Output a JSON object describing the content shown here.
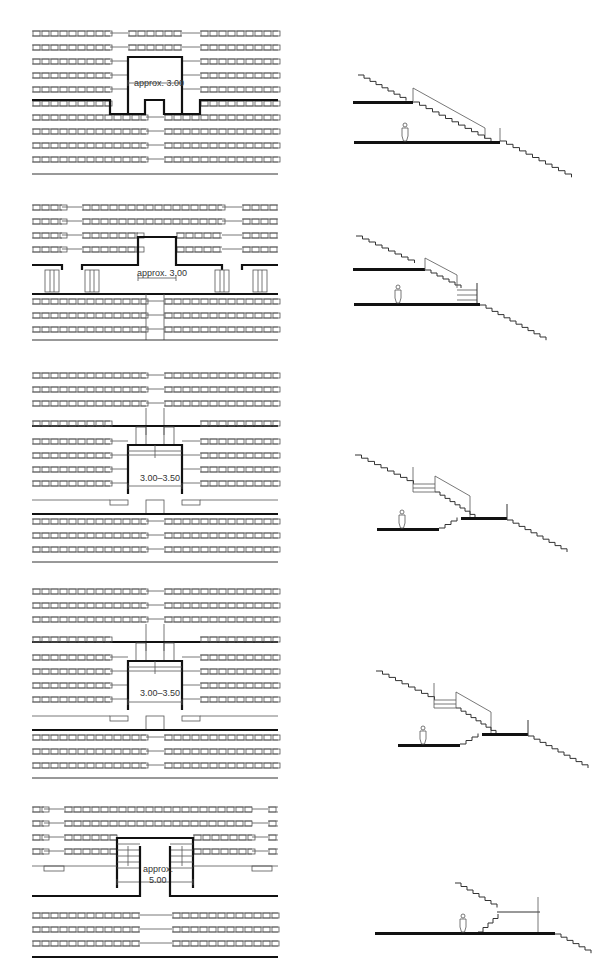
{
  "figure": {
    "type": "architectural stair/seating arrangement comparison",
    "layout": "five rows, each with plan view (left) and section view (right)"
  },
  "rows": [
    {
      "id": 1,
      "plan_label": "approx. 3.00",
      "section": "vomitory entering mid-level walkway, tiers continue above and below"
    },
    {
      "id": 2,
      "plan_label": "approx. 3.00",
      "section": "walkway with short stair down to lower level"
    },
    {
      "id": 3,
      "plan_label": "3.00–3.50",
      "section": "split-level with steps up to raised platform"
    },
    {
      "id": 4,
      "plan_label": "3.00–3.50",
      "section": "split-level with steps up to raised platform"
    },
    {
      "id": 5,
      "plan_label_line1": "approx.",
      "plan_label_line2": "5.00",
      "section": "ground-level concourse with stair rising to upper tier"
    }
  ],
  "colors": {
    "line": "#333333",
    "slab": "#111111",
    "background": "#ffffff"
  }
}
